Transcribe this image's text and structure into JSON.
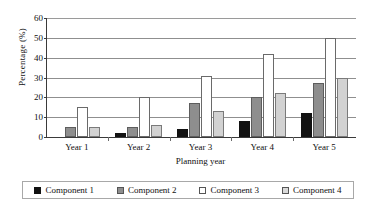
{
  "chart_data": {
    "type": "bar",
    "title": "",
    "xlabel": "Planning year",
    "ylabel": "Percentage (%)",
    "categories": [
      "Year 1",
      "Year 2",
      "Year 3",
      "Year 4",
      "Year 5"
    ],
    "series": [
      {
        "name": "Component 1",
        "color": "#121212",
        "values": [
          0,
          2,
          4,
          8,
          12
        ]
      },
      {
        "name": "Component 2",
        "color": "#8e8e8e",
        "values": [
          5,
          5,
          17,
          20,
          27
        ]
      },
      {
        "name": "Component 3",
        "color": "#ffffff",
        "values": [
          15,
          20,
          31,
          42,
          50
        ]
      },
      {
        "name": "Component 4",
        "color": "#d2d2d2",
        "values": [
          5,
          6,
          13,
          22,
          30
        ]
      }
    ],
    "ylim": [
      0,
      60
    ],
    "yticks": [
      0,
      10,
      20,
      30,
      40,
      50,
      60
    ],
    "ytick_labels": [
      "0",
      "10",
      "20",
      "30",
      "40",
      "50",
      "60"
    ],
    "grid": true,
    "legend_position": "bottom"
  }
}
